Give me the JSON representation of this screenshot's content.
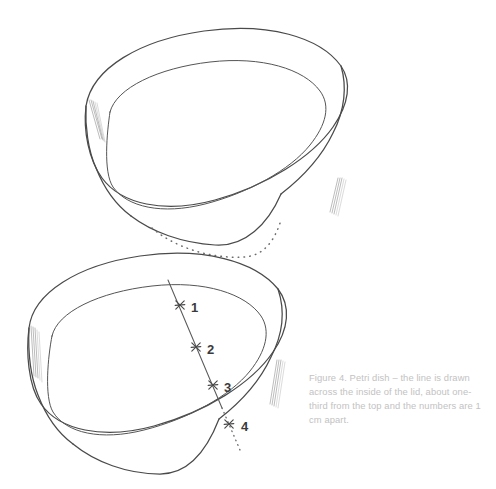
{
  "figure": {
    "caption": "Figure 4. Petri dish – the line is drawn across the inside of the lid, about one-third from the top and the numbers are 1 cm apart.",
    "caption_color": "#c2c2c2",
    "ink_color": "#4a4a4a",
    "background_color": "#ffffff"
  },
  "parts": {
    "lid_label": "lid",
    "base_label": "base dish",
    "lid_outer_rim_label": "lid outer rim",
    "lid_inner_rim_label": "lid inner rim",
    "lid_wall_label": "lid side wall",
    "lid_hidden_edge_label": "lid hidden bottom edge",
    "base_outer_rim_label": "base outer rim",
    "base_inner_rim_label": "base inner rim",
    "base_wall_label": "base side wall",
    "base_bottom_edge_label": "base bottom edge"
  },
  "marks": {
    "line_label": "measurement line",
    "spacing_note": "1 cm apart",
    "points": [
      {
        "label": "1",
        "x": 180,
        "y": 305,
        "num_x": 191,
        "num_y": 312,
        "hidden": false
      },
      {
        "label": "2",
        "x": 196,
        "y": 347,
        "num_x": 207,
        "num_y": 354,
        "hidden": false
      },
      {
        "label": "3",
        "x": 213,
        "y": 385,
        "num_x": 224,
        "num_y": 392,
        "hidden": false
      },
      {
        "label": "4",
        "x": 229,
        "y": 424,
        "num_x": 241,
        "num_y": 431,
        "hidden": true
      }
    ]
  }
}
